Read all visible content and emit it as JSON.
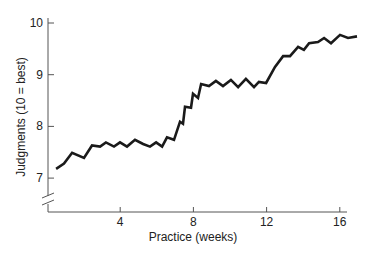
{
  "chart_data": {
    "type": "line",
    "title": "",
    "xlabel": "Practice (weeks)",
    "ylabel": "Judgments (10 = best)",
    "xlim": [
      0,
      16.5
    ],
    "ylim": [
      6.3,
      10.2
    ],
    "y_axis_break": true,
    "grid": false,
    "legend": null,
    "x_ticks": [
      4,
      8,
      12,
      16
    ],
    "x_tick_labels": [
      "4",
      "8",
      "12",
      "16"
    ],
    "y_ticks": [
      7,
      8,
      9,
      10
    ],
    "y_tick_labels": [
      "7",
      "8",
      "9",
      "10"
    ],
    "series": [
      {
        "name": "Judgments",
        "color": "#1a1a1a",
        "x": [
          0.5,
          0.93,
          1.37,
          2.02,
          2.46,
          2.9,
          3.22,
          3.66,
          3.99,
          4.37,
          4.81,
          5.25,
          5.63,
          5.96,
          6.29,
          6.56,
          6.94,
          7.27,
          7.43,
          7.54,
          7.87,
          7.98,
          8.25,
          8.42,
          8.85,
          9.23,
          9.62,
          10.05,
          10.44,
          10.87,
          11.31,
          11.58,
          11.97,
          12.46,
          12.9,
          13.28,
          13.72,
          14.04,
          14.32,
          14.81,
          15.14,
          15.52,
          16.01,
          16.45,
          16.94
        ],
        "y": [
          7.18,
          7.28,
          7.49,
          7.39,
          7.63,
          7.61,
          7.69,
          7.61,
          7.69,
          7.61,
          7.74,
          7.66,
          7.61,
          7.69,
          7.61,
          7.79,
          7.74,
          8.09,
          8.05,
          8.38,
          8.36,
          8.63,
          8.55,
          8.82,
          8.78,
          8.88,
          8.78,
          8.9,
          8.76,
          8.92,
          8.76,
          8.86,
          8.84,
          9.15,
          9.36,
          9.36,
          9.54,
          9.48,
          9.61,
          9.63,
          9.71,
          9.61,
          9.77,
          9.71,
          9.74
        ]
      }
    ]
  }
}
